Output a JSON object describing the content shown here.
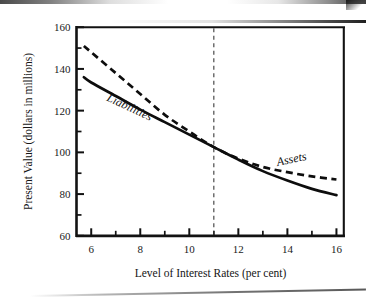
{
  "chart_data": {
    "type": "line",
    "title": "",
    "xlabel": "Level of Interest Rates (per cent)",
    "ylabel": "Present Value (dollars in millions)",
    "xlim": [
      5.4,
      16.3
    ],
    "ylim": [
      60,
      160
    ],
    "xticks": [
      6,
      8,
      10,
      12,
      14,
      16
    ],
    "xticklabels": [
      "6",
      "8",
      "10",
      "12",
      "14",
      "16"
    ],
    "x_minor_ticks": [
      6,
      7,
      8,
      9,
      10,
      11,
      12,
      13,
      14,
      15,
      16
    ],
    "yticks": [
      60,
      80,
      100,
      120,
      140,
      160
    ],
    "yticklabels": [
      "60",
      "80",
      "100",
      "120",
      "140",
      "160"
    ],
    "y_minor_ticks": [
      60,
      70,
      80,
      90,
      100,
      110,
      120,
      130,
      140,
      150,
      160
    ],
    "grid": false,
    "legend": "inline-annotations",
    "x": [
      5.7,
      6,
      7,
      8,
      9,
      10,
      11,
      12,
      13,
      14,
      15,
      16
    ],
    "series": [
      {
        "name": "Assets",
        "style": "dashed",
        "color": "#0d0d0d",
        "values": [
          151,
          148,
          138,
          128,
          118,
          110,
          102.5,
          97,
          93,
          90.5,
          88.5,
          87
        ]
      },
      {
        "name": "Liabilities",
        "style": "solid",
        "color": "#0d0d0d",
        "values": [
          136,
          133.5,
          127,
          120.5,
          114.5,
          108.5,
          102.5,
          96.5,
          91,
          86.5,
          82.5,
          79.5
        ]
      }
    ],
    "annotations": [
      {
        "name": "liabilities-label",
        "text": "Liabilities",
        "x": 7.5,
        "y": 120,
        "rotation": 25,
        "italic": true
      },
      {
        "name": "assets-label",
        "text": "Assets",
        "x": 14.2,
        "y": 95,
        "rotation": -12,
        "italic": true
      }
    ],
    "reference_lines": [
      {
        "name": "crossover-line",
        "orientation": "vertical",
        "x": 11,
        "style": "dashed",
        "color": "#3a3a3a"
      }
    ]
  }
}
